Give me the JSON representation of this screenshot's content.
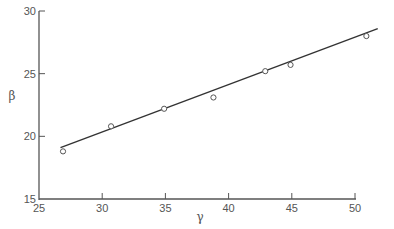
{
  "chart_data": {
    "type": "scatter",
    "title": "",
    "xlabel": "γ",
    "ylabel": "β",
    "xlim": [
      25,
      51.5
    ],
    "ylim": [
      15,
      30
    ],
    "x_ticks": [
      25,
      30,
      35,
      40,
      45,
      50
    ],
    "y_ticks": [
      15,
      20,
      25,
      30
    ],
    "x_tick_labels": [
      "25",
      "30",
      "35",
      "40",
      "45",
      "50"
    ],
    "y_tick_labels": [
      "15",
      "20",
      "25",
      "30"
    ],
    "grid": false,
    "legend": null,
    "series": [
      {
        "name": "observed",
        "marker": "open-circle",
        "x": [
          26.9,
          30.7,
          34.9,
          38.8,
          42.9,
          44.9,
          50.9
        ],
        "y": [
          18.8,
          20.8,
          22.2,
          23.1,
          25.2,
          25.7,
          28.0
        ]
      },
      {
        "name": "fit",
        "style": "line",
        "x": [
          26.7,
          51.8
        ],
        "y": [
          19.1,
          28.6
        ]
      }
    ]
  },
  "colors": {
    "axis": "#555555",
    "line": "#333333",
    "marker": "#555555"
  }
}
